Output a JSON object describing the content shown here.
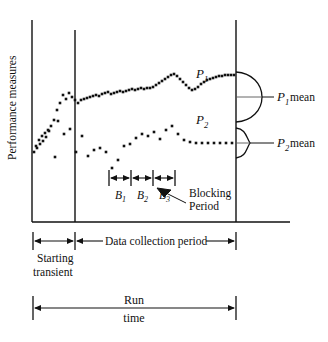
{
  "figure": {
    "axis": {
      "ylabel": "Performance measures",
      "origin_x": 32,
      "baseline_y": 222,
      "top_y": 20,
      "right_x": 290
    },
    "dividers": {
      "warmup_end_x": 75,
      "collection_end_x": 236
    },
    "series": [
      {
        "name": "P1",
        "label": "P",
        "subscript": "1",
        "label_x": 196,
        "label_y": 78,
        "mean_label": "mean",
        "mean_y": 97,
        "distribution": "wide"
      },
      {
        "name": "P2",
        "label": "P",
        "subscript": "2",
        "label_x": 196,
        "label_y": 124,
        "mean_label": "mean",
        "mean_y": 143,
        "distribution": "narrow"
      }
    ],
    "blocks": [
      {
        "label": "B",
        "subscript": "1",
        "x_start": 109,
        "x_end": 131
      },
      {
        "label": "B",
        "subscript": "2",
        "x_start": 131,
        "x_end": 153
      },
      {
        "label": "B",
        "subscript": "3",
        "x_start": 153,
        "x_end": 175
      }
    ],
    "annotations": {
      "blocking_line1": "Blocking",
      "blocking_line2": "Period",
      "starting_line1": "Starting",
      "starting_line2": "transient",
      "data_collection": "Data collection period",
      "run_line1": "Run",
      "run_line2": "time"
    },
    "colors": {
      "ink": "#111111",
      "mean_line": "#555555",
      "background": "#ffffff"
    }
  },
  "chart_data": {
    "type": "scatter",
    "title": "",
    "xlabel": "",
    "ylabel": "Performance measures",
    "grid": false,
    "legend": "inline",
    "xlim": [
      32,
      236
    ],
    "ylim": [
      222,
      20
    ],
    "annotations": {
      "warmup_end_x": 75,
      "collection_end_x": 236,
      "mean_P1_y": 97,
      "mean_P2_y": 143
    },
    "series": [
      {
        "name": "P1",
        "points": [
          [
            36,
            146
          ],
          [
            39,
            140
          ],
          [
            42,
            136
          ],
          [
            45,
            133
          ],
          [
            48,
            130
          ],
          [
            51,
            126
          ],
          [
            54,
            120
          ],
          [
            57,
            110
          ],
          [
            60,
            103
          ],
          [
            63,
            95
          ],
          [
            66,
            99
          ],
          [
            69,
            93
          ],
          [
            72,
            97
          ],
          [
            75,
            100
          ],
          [
            78,
            103
          ],
          [
            81,
            100
          ],
          [
            84,
            99
          ],
          [
            87,
            98
          ],
          [
            90,
            97
          ],
          [
            93,
            96
          ],
          [
            96,
            95
          ],
          [
            99,
            96
          ],
          [
            102,
            94
          ],
          [
            105,
            93
          ],
          [
            108,
            92
          ],
          [
            111,
            94
          ],
          [
            114,
            93
          ],
          [
            117,
            92
          ],
          [
            120,
            91
          ],
          [
            123,
            92
          ],
          [
            126,
            91
          ],
          [
            129,
            90
          ],
          [
            132,
            89
          ],
          [
            135,
            90
          ],
          [
            138,
            89
          ],
          [
            141,
            88
          ],
          [
            144,
            89
          ],
          [
            147,
            88
          ],
          [
            150,
            88
          ],
          [
            153,
            87
          ],
          [
            156,
            85
          ],
          [
            159,
            83
          ],
          [
            162,
            81
          ],
          [
            165,
            79
          ],
          [
            168,
            77
          ],
          [
            171,
            75
          ],
          [
            174,
            74
          ],
          [
            177,
            76
          ],
          [
            180,
            79
          ],
          [
            183,
            82
          ],
          [
            186,
            85
          ],
          [
            189,
            88
          ],
          [
            192,
            90
          ],
          [
            195,
            89
          ],
          [
            198,
            87
          ],
          [
            201,
            84
          ],
          [
            204,
            82
          ],
          [
            207,
            80
          ],
          [
            210,
            79
          ],
          [
            213,
            78
          ],
          [
            216,
            77
          ],
          [
            219,
            76
          ],
          [
            222,
            76
          ],
          [
            225,
            75
          ],
          [
            228,
            75
          ],
          [
            231,
            75
          ],
          [
            234,
            75
          ]
        ]
      },
      {
        "name": "P2",
        "points": [
          [
            34,
            152
          ],
          [
            37,
            148
          ],
          [
            40,
            144
          ],
          [
            43,
            141
          ],
          [
            46,
            137
          ],
          [
            49,
            131
          ],
          [
            55,
            157
          ],
          [
            58,
            121
          ],
          [
            64,
            134
          ],
          [
            70,
            129
          ],
          [
            76,
            152
          ],
          [
            82,
            136
          ],
          [
            88,
            156
          ],
          [
            94,
            150
          ],
          [
            100,
            148
          ],
          [
            106,
            152
          ],
          [
            112,
            168
          ],
          [
            118,
            160
          ],
          [
            124,
            146
          ],
          [
            130,
            144
          ],
          [
            136,
            138
          ],
          [
            142,
            134
          ],
          [
            148,
            136
          ],
          [
            154,
            132
          ],
          [
            160,
            139
          ],
          [
            166,
            130
          ],
          [
            172,
            126
          ],
          [
            178,
            134
          ],
          [
            184,
            140
          ],
          [
            190,
            142
          ],
          [
            196,
            143
          ],
          [
            202,
            143
          ],
          [
            208,
            143
          ],
          [
            214,
            143
          ],
          [
            220,
            143
          ],
          [
            226,
            143
          ],
          [
            232,
            143
          ]
        ]
      }
    ]
  }
}
